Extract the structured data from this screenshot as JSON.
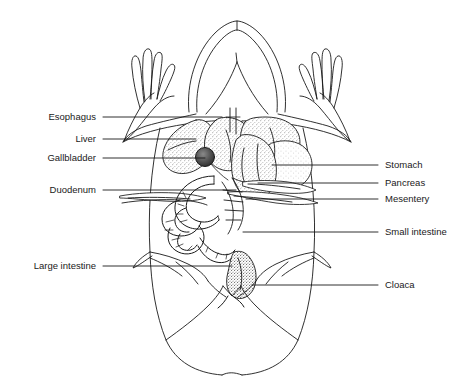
{
  "figure": {
    "background_color": "#ffffff",
    "line_color": "#1a1a1a",
    "stipple_color": "#4a4a4a"
  },
  "labels_left": [
    {
      "id": "esophagus",
      "text": "Esophagus",
      "text_x": 96,
      "text_y": 117,
      "leader_x1": 103,
      "leader_y1": 117,
      "leader_x2": 222,
      "leader_y2": 117
    },
    {
      "id": "liver",
      "text": "Liver",
      "text_x": 96,
      "text_y": 139,
      "leader_x1": 103,
      "leader_y1": 139,
      "leader_x2": 196,
      "leader_y2": 139
    },
    {
      "id": "gallbladder",
      "text": "Gallbladder",
      "text_x": 96,
      "text_y": 158,
      "leader_x1": 103,
      "leader_y1": 158,
      "leader_x2": 205,
      "leader_y2": 158
    },
    {
      "id": "duodenum",
      "text": "Duodenum",
      "text_x": 96,
      "text_y": 190,
      "leader_x1": 103,
      "leader_y1": 190,
      "leader_x2": 236,
      "leader_y2": 190
    },
    {
      "id": "large-intestine",
      "text": "Large intestine",
      "text_x": 96,
      "text_y": 266,
      "leader_x1": 103,
      "leader_y1": 266,
      "leader_x2": 232,
      "leader_y2": 266
    }
  ],
  "labels_right": [
    {
      "id": "stomach",
      "text": "Stomach",
      "text_x": 385,
      "text_y": 165,
      "leader_x1": 272,
      "leader_y1": 165,
      "leader_x2": 378,
      "leader_y2": 165
    },
    {
      "id": "pancreas",
      "text": "Pancreas",
      "text_x": 385,
      "text_y": 183,
      "leader_x1": 258,
      "leader_y1": 183,
      "leader_x2": 378,
      "leader_y2": 183
    },
    {
      "id": "mesentery",
      "text": "Mesentery",
      "text_x": 385,
      "text_y": 199,
      "leader_x1": 246,
      "leader_y1": 199,
      "leader_x2": 378,
      "leader_y2": 199
    },
    {
      "id": "small-intestine",
      "text": "Small intestine",
      "text_x": 385,
      "text_y": 232,
      "leader_x1": 243,
      "leader_y1": 232,
      "leader_x2": 378,
      "leader_y2": 232
    },
    {
      "id": "cloaca",
      "text": "Cloaca",
      "text_x": 385,
      "text_y": 285,
      "leader_x1": 252,
      "leader_y1": 285,
      "leader_x2": 378,
      "leader_y2": 285
    }
  ]
}
